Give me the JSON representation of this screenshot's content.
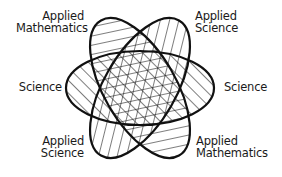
{
  "diagram": {
    "type": "overlapping-ellipses",
    "stroke_color": "#111111",
    "background": "#ffffff",
    "ellipses": [
      {
        "id": "science",
        "rotation_deg": 0,
        "hatch": "diagonal-back"
      },
      {
        "id": "applied-mathematics",
        "rotation_deg": 60,
        "hatch": "near-vertical"
      },
      {
        "id": "applied-science",
        "rotation_deg": -60,
        "hatch": "near-horizontal"
      }
    ],
    "labels": {
      "top_left": [
        "Applied",
        "Mathematics"
      ],
      "top_right": [
        "Applied",
        "Science"
      ],
      "mid_left": [
        "Science"
      ],
      "mid_right": [
        "Science"
      ],
      "bottom_left": [
        "Applied",
        "Science"
      ],
      "bottom_right": [
        "Applied",
        "Mathematics"
      ]
    }
  }
}
